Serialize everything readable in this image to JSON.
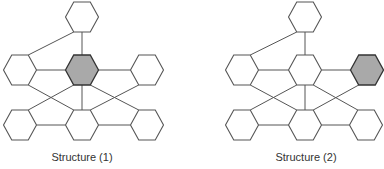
{
  "figure": {
    "type": "hexagonal-node network diagrams",
    "node_shape": "hexagon",
    "colors": {
      "stroke": "#555555",
      "shaded_fill": "#a9a9a9",
      "fill": "#ffffff"
    }
  },
  "structures": [
    {
      "caption": "Structure (1)",
      "caption_x": 82,
      "nodes": [
        {
          "id": "top",
          "cx": 82,
          "cy": 17,
          "shaded": false
        },
        {
          "id": "mid-left",
          "cx": 20,
          "cy": 70,
          "shaded": false
        },
        {
          "id": "mid-center",
          "cx": 82,
          "cy": 70,
          "shaded": true
        },
        {
          "id": "mid-right",
          "cx": 147,
          "cy": 70,
          "shaded": false
        },
        {
          "id": "bot-left",
          "cx": 20,
          "cy": 125,
          "shaded": false
        },
        {
          "id": "bot-center",
          "cx": 82,
          "cy": 125,
          "shaded": false
        },
        {
          "id": "bot-right",
          "cx": 147,
          "cy": 125,
          "shaded": false
        }
      ]
    },
    {
      "caption": "Structure (2)",
      "caption_x": 306,
      "nodes": [
        {
          "id": "top",
          "cx": 305,
          "cy": 17,
          "shaded": false
        },
        {
          "id": "mid-left",
          "cx": 242,
          "cy": 70,
          "shaded": false
        },
        {
          "id": "mid-center",
          "cx": 305,
          "cy": 70,
          "shaded": false
        },
        {
          "id": "mid-right",
          "cx": 367,
          "cy": 70,
          "shaded": true
        },
        {
          "id": "bot-left",
          "cx": 242,
          "cy": 125,
          "shaded": false
        },
        {
          "id": "bot-center",
          "cx": 305,
          "cy": 125,
          "shaded": false
        },
        {
          "id": "bot-right",
          "cx": 366,
          "cy": 125,
          "shaded": false
        }
      ]
    }
  ],
  "edges": [
    [
      "top",
      "mid-left"
    ],
    [
      "top",
      "mid-center"
    ],
    [
      "mid-left",
      "mid-center"
    ],
    [
      "mid-center",
      "mid-right"
    ],
    [
      "mid-left",
      "bot-center"
    ],
    [
      "mid-center",
      "bot-left"
    ],
    [
      "mid-center",
      "bot-center"
    ],
    [
      "mid-center",
      "bot-right"
    ],
    [
      "mid-right",
      "bot-center"
    ],
    [
      "bot-left",
      "bot-center"
    ],
    [
      "bot-center",
      "bot-right"
    ]
  ]
}
